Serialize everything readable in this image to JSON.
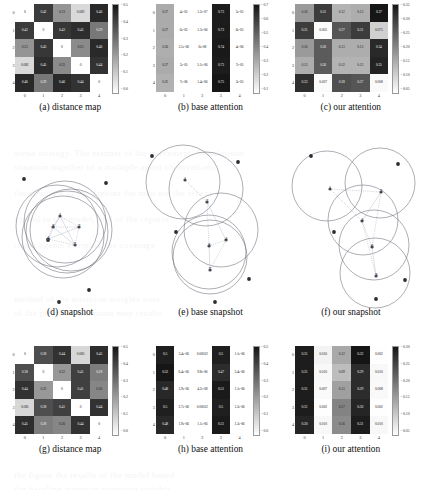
{
  "figure": {
    "panels": [
      {
        "tag": "(a)",
        "caption": "(a) distance map",
        "kind": "heatmap"
      },
      {
        "tag": "(b)",
        "caption": "(b) base attention",
        "kind": "heatmap"
      },
      {
        "tag": "(c)",
        "caption": "(c) our attention",
        "kind": "heatmap"
      },
      {
        "tag": "(d)",
        "caption": "(d) snapshot",
        "kind": "snapshot"
      },
      {
        "tag": "(e)",
        "caption": "(e) base snapshot",
        "kind": "snapshot"
      },
      {
        "tag": "(f)",
        "caption": "(f) our snapshot",
        "kind": "snapshot"
      },
      {
        "tag": "(g)",
        "caption": "(g) distance map",
        "kind": "heatmap"
      },
      {
        "tag": "(h)",
        "caption": "(h) base attention",
        "kind": "heatmap"
      },
      {
        "tag": "(i)",
        "caption": "(i) our attention",
        "kind": "heatmap"
      }
    ]
  },
  "chart_data": [
    {
      "id": "a",
      "type": "heatmap",
      "title": "(a) distance map",
      "xlabel": "",
      "ylabel": "",
      "xticks": [
        "0",
        "1",
        "2",
        "3",
        "4"
      ],
      "yticks": [
        "0",
        "1",
        "2",
        "3",
        "4"
      ],
      "colormap": "gray_r",
      "colorbar_ticks": [
        "0.5",
        "0.4",
        "0.3",
        "0.2",
        "0.1",
        "0.0"
      ],
      "vmin": 0.0,
      "vmax": 0.5,
      "values": [
        [
          0.0,
          0.42,
          0.23,
          0.082,
          0.46
        ],
        [
          0.42,
          0.0,
          0.43,
          0.45,
          0.29
        ],
        [
          0.23,
          0.43,
          0.0,
          0.25,
          0.46
        ],
        [
          0.082,
          0.45,
          0.25,
          0.0,
          0.44
        ],
        [
          0.46,
          0.29,
          0.46,
          0.44,
          0.0
        ]
      ],
      "labels": [
        [
          "0",
          "0.42",
          "0.23",
          "0.082",
          "0.46"
        ],
        [
          "0.42",
          "0",
          "0.43",
          "0.45",
          "0.29"
        ],
        [
          "0.23",
          "0.43",
          "0",
          "0.25",
          "0.46"
        ],
        [
          "0.082",
          "0.45",
          "0.25",
          "0",
          "0.44"
        ],
        [
          "0.46",
          "0.29",
          "0.46",
          "0.44",
          "0"
        ]
      ]
    },
    {
      "id": "b",
      "type": "heatmap",
      "title": "(b) base attention",
      "xlabel": "",
      "ylabel": "",
      "xticks": [
        "0",
        "1",
        "2",
        "3",
        "4"
      ],
      "yticks": [
        "0",
        "1",
        "2",
        "3",
        "4"
      ],
      "colormap": "gray_r",
      "colorbar_ticks": [
        "0.7",
        "0.6",
        "0.5",
        "0.4",
        "0.3",
        "0.2",
        "0.1"
      ],
      "vmin": 0.0,
      "vmax": 0.75,
      "values": [
        [
          0.27,
          4e-05,
          1.2e-06,
          0.73,
          5e-05
        ],
        [
          0.27,
          6e-05,
          1.3e-06,
          0.73,
          6e-05
        ],
        [
          0.26,
          3.1e-06,
          6.2e-08,
          0.74,
          4e-06
        ],
        [
          0.27,
          3e-05,
          5.1e-06,
          0.73,
          7e-05
        ],
        [
          0.25,
          7.2e-06,
          1.4e-06,
          0.75,
          3e-05
        ]
      ],
      "labels": [
        [
          "0.27",
          "4e-05",
          "1.2e-07",
          "0.73",
          "5e-05"
        ],
        [
          "0.27",
          "6e-05",
          "1.3e-06",
          "0.73",
          "6e-05"
        ],
        [
          "0.26",
          "3.1e-06",
          "6e-08",
          "0.74",
          "4e-06"
        ],
        [
          "0.27",
          "3e-05",
          "5.1e-06",
          "0.73",
          "7e-05"
        ],
        [
          "0.25",
          "7e-06",
          "1.4e-06",
          "0.75",
          "3e-05"
        ]
      ]
    },
    {
      "id": "c",
      "type": "heatmap",
      "title": "(c) our attention",
      "xlabel": "",
      "ylabel": "",
      "xticks": [
        "0",
        "1",
        "2",
        "3",
        "4"
      ],
      "yticks": [
        "0",
        "1",
        "2",
        "3",
        "4"
      ],
      "colormap": "gray_r",
      "colorbar_ticks": [
        "0.35",
        "0.30",
        "0.25",
        "0.20",
        "0.15",
        "0.10",
        "0.05"
      ],
      "vmin": 0.0,
      "vmax": 0.37,
      "values": [
        [
          0.16,
          0.31,
          0.12,
          0.13,
          0.37
        ],
        [
          0.31,
          0.005,
          0.27,
          0.31,
          0.075
        ],
        [
          0.16,
          0.26,
          0.13,
          0.13,
          0.34
        ],
        [
          0.13,
          0.26,
          0.12,
          0.12,
          0.35
        ],
        [
          0.33,
          0.007,
          0.28,
          0.27,
          0.008
        ]
      ],
      "labels": [
        [
          "0.16",
          "0.31",
          "0.12",
          "0.13",
          "0.37"
        ],
        [
          "0.31",
          "0.005",
          "0.27",
          "0.31",
          "0.075"
        ],
        [
          "0.16",
          "0.26",
          "0.13",
          "0.13",
          "0.34"
        ],
        [
          "0.13",
          "0.26",
          "0.12",
          "0.12",
          "0.35"
        ],
        [
          "0.33",
          "0.007",
          "0.28",
          "0.27",
          "0.008"
        ]
      ]
    },
    {
      "id": "g",
      "type": "heatmap",
      "title": "(g) distance map",
      "xlabel": "",
      "ylabel": "",
      "xticks": [
        "0",
        "1",
        "2",
        "3",
        "4"
      ],
      "yticks": [
        "0",
        "1",
        "2",
        "3",
        "4"
      ],
      "colormap": "gray_r",
      "colorbar_ticks": [
        "0.5",
        "0.4",
        "0.3",
        "0.2",
        "0.1",
        "0.0"
      ],
      "vmin": 0.0,
      "vmax": 0.5,
      "values": [
        [
          0.0,
          0.38,
          0.44,
          0.085,
          0.45
        ],
        [
          0.38,
          0.0,
          0.22,
          0.41,
          0.28
        ],
        [
          0.44,
          0.22,
          0.0,
          0.41,
          0.26
        ],
        [
          0.085,
          0.38,
          0.41,
          0.0,
          0.44
        ],
        [
          0.45,
          0.28,
          0.26,
          0.44,
          0.0
        ]
      ],
      "labels": [
        [
          "0",
          "0.38",
          "0.44",
          "0.085",
          "0.45"
        ],
        [
          "0.38",
          "0",
          "0.22",
          "0.41",
          "0.28"
        ],
        [
          "0.44",
          "0.22",
          "0",
          "0.41",
          "0.26"
        ],
        [
          "0.085",
          "0.38",
          "0.41",
          "0",
          "0.44"
        ],
        [
          "0.45",
          "0.28",
          "0.26",
          "0.44",
          "0"
        ]
      ]
    },
    {
      "id": "h",
      "type": "heatmap",
      "title": "(h) base attention",
      "xlabel": "",
      "ylabel": "",
      "xticks": [
        "0",
        "1",
        "2",
        "3",
        "4"
      ],
      "yticks": [
        "0",
        "1",
        "2",
        "3",
        "4"
      ],
      "colormap": "gray_r",
      "colorbar_ticks": [
        "0.5",
        "0.4",
        "0.3",
        "0.2",
        "0.1",
        "0.0"
      ],
      "vmin": 0.0,
      "vmax": 0.52,
      "values": [
        [
          0.5,
          3e-06,
          0.00012,
          0.5,
          1.1e-06
        ],
        [
          0.52,
          6.4e-06,
          9.8e-06,
          0.47,
          3.4e-06
        ],
        [
          0.48,
          1.9e-06,
          4.2e-08,
          0.51,
          1.1e-06
        ],
        [
          0.5,
          2.7e-06,
          0.00012,
          0.5,
          1.2e-06
        ],
        [
          0.48,
          1.9e-06,
          1.1e-06,
          0.51,
          1.3e-06
        ]
      ],
      "labels": [
        [
          "0.5",
          "3.4e-06",
          "0.00012",
          "0.5",
          "1.1e-06"
        ],
        [
          "0.52",
          "6.4e-06",
          "9.8e-06",
          "0.47",
          "3.4e-06"
        ],
        [
          "0.48",
          "1.9e-06",
          "4.2e-08",
          "0.51",
          "1.1e-06"
        ],
        [
          "0.5",
          "2.7e-06",
          "0.00012",
          "0.5",
          "1.2e-06"
        ],
        [
          "0.48",
          "1.9e-06",
          "1.1e-06",
          "0.51",
          "1.3e-06"
        ]
      ]
    },
    {
      "id": "i",
      "type": "heatmap",
      "title": "(i) our attention",
      "xlabel": "",
      "ylabel": "",
      "xticks": [
        "0",
        "1",
        "2",
        "3",
        "4"
      ],
      "yticks": [
        "0",
        "1",
        "2",
        "3",
        "4"
      ],
      "colormap": "gray_r",
      "colorbar_ticks": [
        "0.30",
        "0.25",
        "0.20",
        "0.15",
        "0.10",
        "0.05"
      ],
      "vmin": 0.0,
      "vmax": 0.32,
      "values": [
        [
          0.31,
          0.016,
          0.12,
          0.32,
          0.002
        ],
        [
          0.31,
          0.01,
          0.09,
          0.29,
          0.01
        ],
        [
          0.31,
          0.007,
          0.13,
          0.29,
          0.008
        ],
        [
          0.31,
          0.002,
          0.17,
          0.3,
          0.002
        ],
        [
          0.3,
          0.01,
          0.16,
          0.31,
          0.01
        ]
      ],
      "labels": [
        [
          "0.31",
          "0.016",
          "0.12",
          "0.32",
          "0.002"
        ],
        [
          "0.31",
          "0.010",
          "0.09",
          "0.29",
          "0.010"
        ],
        [
          "0.31",
          "0.007",
          "0.13",
          "0.29",
          "0.008"
        ],
        [
          "0.31",
          "0.002",
          "0.17",
          "0.30",
          "0.002"
        ],
        [
          "0.30",
          "0.010",
          "0.16",
          "0.31",
          "0.010"
        ]
      ]
    },
    {
      "id": "d",
      "type": "scatter",
      "title": "(d) snapshot",
      "xlabel": "",
      "ylabel": "",
      "description": "overlapping coverage circles clustered near centre with five numbered nodes and scattered target points",
      "node_labels": [
        "1",
        "2",
        "3",
        "4",
        "5"
      ],
      "nodes": [
        {
          "label": "1",
          "x": 57,
          "y": 74
        },
        {
          "label": "2",
          "x": 76,
          "y": 85
        },
        {
          "label": "3",
          "x": 50,
          "y": 85
        },
        {
          "label": "4",
          "x": 45,
          "y": 97
        },
        {
          "label": "5",
          "x": 72,
          "y": 103
        }
      ],
      "circles": [
        {
          "cx": 54,
          "cy": 84,
          "r": 41
        },
        {
          "cx": 62,
          "cy": 80,
          "r": 41
        },
        {
          "cx": 68,
          "cy": 88,
          "r": 41
        },
        {
          "cx": 60,
          "cy": 95,
          "r": 41
        },
        {
          "cx": 64,
          "cy": 90,
          "r": 41
        }
      ],
      "targets": [
        {
          "x": 21,
          "y": 37
        },
        {
          "x": 103,
          "y": 41
        },
        {
          "x": 45,
          "y": 98
        },
        {
          "x": 86,
          "y": 148
        },
        {
          "x": 56,
          "y": 160
        }
      ]
    },
    {
      "id": "e",
      "type": "scatter",
      "title": "(e) base snapshot",
      "xlabel": "",
      "ylabel": "",
      "description": "five coverage circles arranged in a diagonal chain with numbered nodes and dotted links",
      "node_labels": [
        "1",
        "2",
        "3",
        "4",
        "5"
      ],
      "nodes": [
        {
          "label": "1",
          "x": 42,
          "y": 38
        },
        {
          "label": "2",
          "x": 64,
          "y": 60
        },
        {
          "label": "3",
          "x": 66,
          "y": 104
        },
        {
          "label": "4",
          "x": 83,
          "y": 98
        },
        {
          "label": "5",
          "x": 67,
          "y": 128
        }
      ],
      "circles": [
        {
          "cx": 40,
          "cy": 40,
          "r": 37
        },
        {
          "cx": 63,
          "cy": 47,
          "r": 37
        },
        {
          "cx": 78,
          "cy": 88,
          "r": 37
        },
        {
          "cx": 67,
          "cy": 115,
          "r": 37
        },
        {
          "cx": 66,
          "cy": 110,
          "r": 37
        }
      ],
      "targets": [
        {
          "x": 9,
          "y": 14
        },
        {
          "x": 95,
          "y": 20
        },
        {
          "x": 33,
          "y": 90
        },
        {
          "x": 106,
          "y": 137
        },
        {
          "x": 72,
          "y": 160
        }
      ]
    },
    {
      "id": "f",
      "type": "scatter",
      "title": "(f) our snapshot",
      "xlabel": "",
      "ylabel": "",
      "description": "five coverage circles spread to cover targets with numbered nodes and link lines",
      "node_labels": [
        "1",
        "2",
        "3",
        "4",
        "5"
      ],
      "nodes": [
        {
          "label": "1",
          "x": 47,
          "y": 47
        },
        {
          "label": "2",
          "x": 98,
          "y": 50
        },
        {
          "label": "3",
          "x": 93,
          "y": 134
        },
        {
          "label": "4",
          "x": 79,
          "y": 79
        },
        {
          "label": "6",
          "x": 89,
          "y": 105
        }
      ],
      "circles": [
        {
          "cx": 44,
          "cy": 44,
          "r": 35
        },
        {
          "cx": 97,
          "cy": 41,
          "r": 35
        },
        {
          "cx": 80,
          "cy": 78,
          "r": 35
        },
        {
          "cx": 91,
          "cy": 103,
          "r": 35
        },
        {
          "cx": 92,
          "cy": 131,
          "r": 35
        }
      ],
      "targets": [
        {
          "x": 28,
          "y": 14
        },
        {
          "x": 115,
          "y": 22
        },
        {
          "x": 51,
          "y": 90
        },
        {
          "x": 122,
          "y": 138
        },
        {
          "x": 93,
          "y": 157
        }
      ]
    }
  ]
}
